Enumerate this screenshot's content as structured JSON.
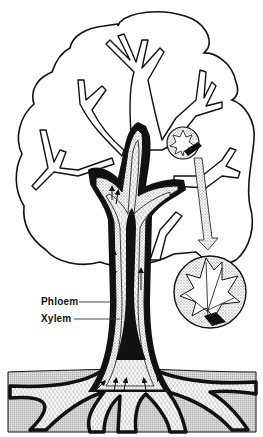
{
  "diagram": {
    "labels": [
      {
        "id": "phloem",
        "text": "Phloem",
        "x": 41,
        "y": 297,
        "leader_to_x": 113,
        "leader_y": 302
      },
      {
        "id": "xylem",
        "text": "Xylem",
        "x": 41,
        "y": 314,
        "leader_to_x": 120,
        "leader_y": 319
      }
    ],
    "parts": [
      "crown-outline",
      "branches",
      "trunk",
      "phloem-layer",
      "xylem-layer",
      "heartwood",
      "roots",
      "soil",
      "leaf-inset-small",
      "leaf-inset-large",
      "transport-arrows"
    ],
    "colors": {
      "ink": "#111111",
      "stipple": "#d9d9d9",
      "soil": "#cfcfcf",
      "background": "#ffffff"
    }
  }
}
